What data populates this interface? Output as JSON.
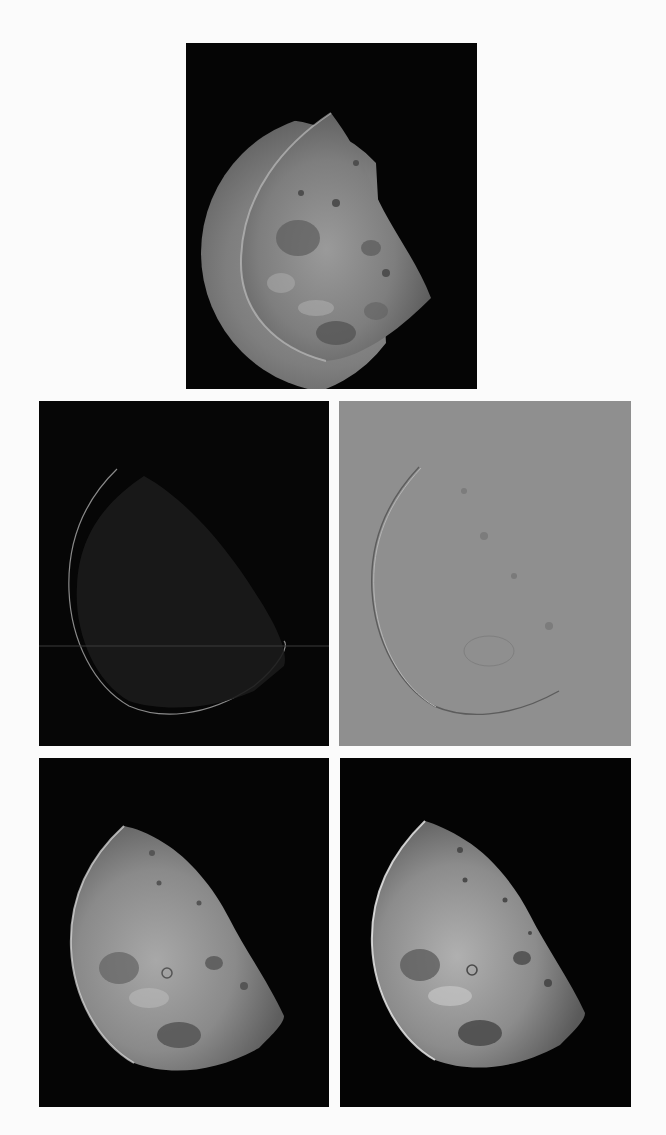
{
  "figure": {
    "layout": "1 image on top row, 2x2 grid below",
    "background_color": "#fbfbfb",
    "panels": [
      {
        "id": "a",
        "position": "top-center",
        "description": "Original image of the north pole of the moon (half moon, grayscale)",
        "background": "#050505"
      },
      {
        "id": "b",
        "position": "middle-left",
        "description": "Laplacian-filtered image (edges on dark background, thin horizontal line artifact)",
        "background": "#060606"
      },
      {
        "id": "c",
        "position": "middle-right",
        "description": "Laplacian image scaled for display (gray background, embossed outline)",
        "background": "#8f8f8f"
      },
      {
        "id": "d",
        "position": "bottom-left",
        "description": "Image enhanced by subtracting Laplacian (mask center -4)",
        "background": "#050505"
      },
      {
        "id": "e",
        "position": "bottom-right",
        "description": "Image enhanced by subtracting Laplacian (mask center -8, sharper)",
        "background": "#040404"
      }
    ]
  }
}
